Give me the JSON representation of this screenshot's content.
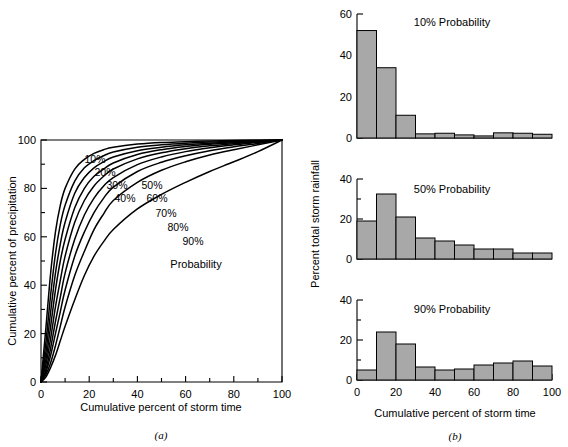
{
  "figure": {
    "panel_a_caption": "(a)",
    "panel_b_caption": "(b)"
  },
  "chart_data": [
    {
      "type": "line",
      "id": "panel-a",
      "title": "",
      "xlabel": "Cumulative percent of storm time",
      "ylabel": "Cumulative percent of precipitation",
      "xlim": [
        0,
        100
      ],
      "ylim": [
        0,
        100
      ],
      "xticks": [
        0,
        20,
        40,
        60,
        80,
        100
      ],
      "yticks": [
        0,
        20,
        40,
        60,
        80,
        100
      ],
      "xminorticks": [
        10,
        30,
        50,
        70,
        90
      ],
      "yminorticks": [
        10,
        30,
        50,
        70,
        90
      ],
      "grid": false,
      "legend_position": "inline-labels",
      "annotation": "Probability",
      "x": [
        0,
        2,
        4,
        6,
        8,
        10,
        14,
        18,
        22,
        26,
        30,
        40,
        50,
        60,
        70,
        80,
        90,
        100
      ],
      "series": [
        {
          "name": "10%",
          "values": [
            0,
            22,
            45,
            62,
            73,
            80,
            88,
            92,
            94.5,
            96,
            97,
            98.3,
            99,
            99.3,
            99.6,
            99.8,
            99.9,
            100
          ]
        },
        {
          "name": "20%",
          "values": [
            0,
            16,
            36,
            53,
            65,
            73,
            83,
            88.5,
            91.5,
            93.5,
            95,
            97,
            98,
            98.7,
            99.2,
            99.5,
            99.8,
            100
          ]
        },
        {
          "name": "30%",
          "values": [
            0,
            12,
            29,
            45,
            57,
            66,
            78,
            84.5,
            88.5,
            91,
            93,
            95.6,
            97,
            98,
            98.7,
            99.2,
            99.6,
            100
          ]
        },
        {
          "name": "40%",
          "values": [
            0,
            9,
            23,
            38,
            50,
            59,
            72,
            80,
            85,
            88,
            90.5,
            94,
            96,
            97.3,
            98.2,
            98.9,
            99.4,
            100
          ]
        },
        {
          "name": "50%",
          "values": [
            0,
            7,
            18,
            31,
            42,
            52,
            66,
            75,
            81,
            85,
            88,
            92.2,
            94.7,
            96.4,
            97.6,
            98.5,
            99.2,
            100
          ]
        },
        {
          "name": "60%",
          "values": [
            0,
            5,
            14,
            25,
            35,
            45,
            59,
            69,
            76,
            81,
            84.5,
            89.8,
            93,
            95.2,
            96.8,
            98,
            99,
            100
          ]
        },
        {
          "name": "70%",
          "values": [
            0,
            4,
            11,
            20,
            29,
            38,
            52,
            62,
            70,
            76,
            80.5,
            87,
            90.8,
            93.5,
            95.6,
            97.2,
            98.6,
            100
          ]
        },
        {
          "name": "80%",
          "values": [
            0,
            3,
            8,
            15,
            23,
            31,
            44,
            54,
            63,
            69.5,
            75,
            82.5,
            87.5,
            91,
            93.8,
            96,
            98,
            100
          ]
        },
        {
          "name": "90%",
          "values": [
            0,
            2,
            6,
            11,
            17,
            23,
            34,
            44,
            52,
            58,
            63,
            71.5,
            77.5,
            82.5,
            87,
            91,
            95.2,
            100
          ]
        }
      ]
    },
    {
      "type": "bar",
      "id": "panel-b-top",
      "title": "10% Probability",
      "xlabel": "",
      "ylabel": "",
      "xlim": [
        0,
        100
      ],
      "ylim": [
        0,
        60
      ],
      "yticks": [
        0,
        20,
        40,
        60
      ],
      "categories": [
        "0-10",
        "10-20",
        "20-30",
        "30-40",
        "40-50",
        "50-60",
        "60-70",
        "70-80",
        "80-90",
        "90-100"
      ],
      "bin_edges": [
        0,
        10,
        20,
        30,
        40,
        50,
        60,
        70,
        80,
        90,
        100
      ],
      "values": [
        52,
        34,
        11,
        2,
        2.3,
        1.5,
        1,
        2.5,
        2.3,
        1.8
      ]
    },
    {
      "type": "bar",
      "id": "panel-b-middle",
      "title": "50% Probability",
      "xlabel": "",
      "ylabel": "Percent total storm rainfall",
      "xlim": [
        0,
        100
      ],
      "ylim": [
        0,
        40
      ],
      "yticks": [
        0,
        20,
        40
      ],
      "categories": [
        "0-10",
        "10-20",
        "20-30",
        "30-40",
        "40-50",
        "50-60",
        "60-70",
        "70-80",
        "80-90",
        "90-100"
      ],
      "bin_edges": [
        0,
        10,
        20,
        30,
        40,
        50,
        60,
        70,
        80,
        90,
        100
      ],
      "values": [
        19,
        32.5,
        21,
        10.5,
        9,
        7,
        5,
        5,
        3,
        3
      ]
    },
    {
      "type": "bar",
      "id": "panel-b-bottom",
      "title": "90% Probability",
      "xlabel": "Cumulative percent of storm time",
      "ylabel": "",
      "xlim": [
        0,
        100
      ],
      "ylim": [
        0,
        40
      ],
      "yticks": [
        0,
        20,
        40
      ],
      "xticks": [
        0,
        20,
        40,
        60,
        80,
        100
      ],
      "categories": [
        "0-10",
        "10-20",
        "20-30",
        "30-40",
        "40-50",
        "50-60",
        "60-70",
        "70-80",
        "80-90",
        "90-100"
      ],
      "bin_edges": [
        0,
        10,
        20,
        30,
        40,
        50,
        60,
        70,
        80,
        90,
        100
      ],
      "values": [
        5,
        24,
        18,
        6.5,
        5,
        5.5,
        7.5,
        8.5,
        9.5,
        7
      ]
    }
  ],
  "colors": {
    "bar_fill": "#a8a8a8",
    "line": "#000000",
    "background": "#ffffff"
  }
}
